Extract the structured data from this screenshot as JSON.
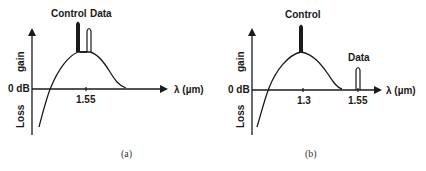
{
  "panels": [
    {
      "id": "a",
      "caption": "(a)",
      "y_axis": {
        "upper_label": "gain",
        "lower_label": "Loss",
        "zero_label": "0 dB"
      },
      "x_axis": {
        "label": "λ (µm)",
        "ticks": [
          "1.55"
        ]
      },
      "signals": [
        {
          "name": "Control",
          "label": "Control",
          "wavelength": "1.55 (slightly below)"
        },
        {
          "name": "Data",
          "label": "Data",
          "wavelength": "1.55 (slightly above)"
        }
      ],
      "gain_peak_wavelength": "1.55"
    },
    {
      "id": "b",
      "caption": "(b)",
      "y_axis": {
        "upper_label": "gain",
        "lower_label": "Loss",
        "zero_label": "0 dB"
      },
      "x_axis": {
        "label": "λ (µm)",
        "ticks": [
          "1.3",
          "1.55"
        ]
      },
      "signals": [
        {
          "name": "Control",
          "label": "Control",
          "wavelength": "1.3"
        },
        {
          "name": "Data",
          "label": "Data",
          "wavelength": "1.55"
        }
      ],
      "gain_peak_wavelength": "1.3"
    }
  ]
}
